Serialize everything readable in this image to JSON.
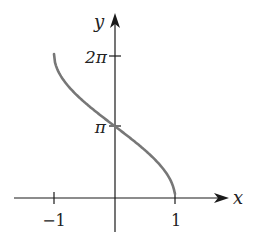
{
  "chart_data": {
    "type": "line",
    "title": "",
    "function": "y = 2 arccos(x)",
    "xlabel": "x",
    "ylabel": "y",
    "xlim": [
      -1.5,
      1.5
    ],
    "ylim": [
      0,
      2.6
    ],
    "x_ticks": [
      {
        "value": -1,
        "label": "−1"
      },
      {
        "value": 1,
        "label": "1"
      }
    ],
    "y_ticks": [
      {
        "value": 3.14159,
        "label": "π"
      },
      {
        "value": 6.28319,
        "label": "2π"
      }
    ],
    "grid": false,
    "legend": null,
    "series": [
      {
        "name": "curve",
        "color": "#777777",
        "x": [
          -1,
          -0.9,
          -0.75,
          -0.5,
          -0.25,
          0,
          0.25,
          0.5,
          0.75,
          0.9,
          1
        ],
        "y": [
          6.283,
          5.393,
          4.838,
          4.189,
          3.647,
          3.142,
          2.636,
          2.094,
          1.445,
          0.902,
          0
        ]
      }
    ]
  },
  "labels": {
    "x_axis": "x",
    "y_axis": "y",
    "tick_neg1": "−1",
    "tick_1": "1",
    "tick_pi": "π",
    "tick_2pi": "2π"
  },
  "colors": {
    "axis": "#1a1a1a",
    "curve": "#777777"
  }
}
